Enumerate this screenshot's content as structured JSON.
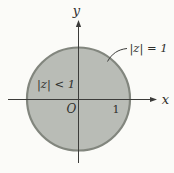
{
  "figure": {
    "y_axis_label": "y",
    "x_axis_label": "x",
    "origin_label": "O",
    "unit_tick_label": "1",
    "boundary_label": "|z| = 1",
    "interior_label": "|z| < 1"
  },
  "colors": {
    "background": "#fbfbf8",
    "disk_fill": "#b9bcb6",
    "disk_stroke": "#82867e",
    "axis": "#3c3c3a",
    "text": "#2f2f2d"
  }
}
